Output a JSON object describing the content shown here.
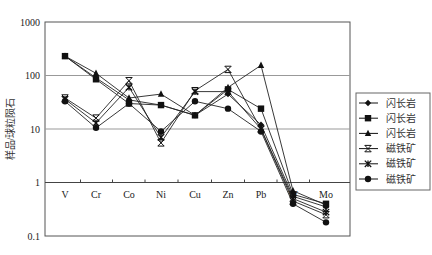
{
  "chart_data": {
    "type": "line",
    "title": "",
    "xlabel": "",
    "ylabel": "样品/球粒陨石",
    "yscale": "log",
    "ylim": [
      0.1,
      1000
    ],
    "yticks": [
      "1000",
      "100",
      "10",
      "1",
      "0.1"
    ],
    "grid": "horizontal at decades",
    "legend_position": "right",
    "categories": [
      "V",
      "Cr",
      "Co",
      "Ni",
      "Cu",
      "Zn",
      "Pb",
      "W",
      "Mo"
    ],
    "series": [
      {
        "name": "闪长岩",
        "marker": "diamond",
        "values": [
          230,
          90,
          35,
          28,
          18,
          45,
          12,
          0.55,
          0.35
        ]
      },
      {
        "name": "闪长岩",
        "marker": "square",
        "values": [
          230,
          85,
          30,
          28,
          18,
          55,
          24,
          0.6,
          0.4
        ]
      },
      {
        "name": "闪长岩",
        "marker": "triangle",
        "values": [
          230,
          110,
          38,
          45,
          18,
          60,
          155,
          0.7,
          0.38
        ]
      },
      {
        "name": "磁铁矿",
        "marker": "x",
        "values": [
          38,
          16,
          80,
          5.5,
          52,
          130,
          10,
          0.45,
          0.25
        ]
      },
      {
        "name": "磁铁矿",
        "marker": "asterisk",
        "values": [
          36,
          13,
          60,
          7,
          50,
          50,
          10,
          0.5,
          0.28
        ]
      },
      {
        "name": "磁铁矿",
        "marker": "circle",
        "values": [
          33,
          10.5,
          30,
          9,
          33,
          24,
          9,
          0.4,
          0.18
        ]
      }
    ]
  },
  "legend": [
    {
      "label": "闪长岩",
      "marker": "diamond"
    },
    {
      "label": "闪长岩",
      "marker": "square"
    },
    {
      "label": "闪长岩",
      "marker": "triangle"
    },
    {
      "label": "磁铁矿",
      "marker": "x"
    },
    {
      "label": "磁铁矿",
      "marker": "asterisk"
    },
    {
      "label": "磁铁矿",
      "marker": "circle"
    }
  ],
  "colors": {
    "line": "#222222",
    "grid": "#999999",
    "axis": "#555555"
  }
}
